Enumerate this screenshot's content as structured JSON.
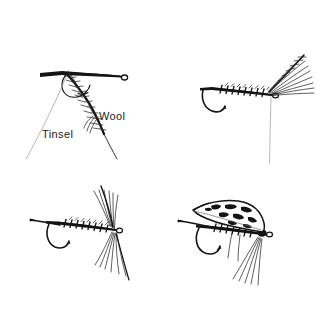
{
  "figure": {
    "background_color": "#ffffff",
    "ink_color": "#141414",
    "width": 330,
    "height": 324
  },
  "labels": {
    "wool": "Wool",
    "tinsel": "Tinsel"
  },
  "panels": [
    {
      "id": "panel-top-left",
      "name": "step-1-tinsel-and-wool",
      "position": "top-left",
      "components": [
        "hook",
        "tinsel-strand",
        "wool-chenille",
        "hook-eye",
        "hook-bend"
      ]
    },
    {
      "id": "panel-top-right",
      "name": "step-2-hackle-wing",
      "position": "top-right",
      "components": [
        "hook",
        "ribbed-body",
        "hackle-fibers",
        "hook-eye",
        "hook-bend",
        "thread-hang"
      ]
    },
    {
      "id": "panel-bottom-left",
      "name": "step-3-swept-hackle",
      "position": "bottom-left",
      "components": [
        "hook",
        "ribbed-body",
        "swept-hackle-fibers",
        "hook-eye",
        "hook-bend",
        "tail"
      ]
    },
    {
      "id": "panel-bottom-right",
      "name": "step-4-barred-feather-wing",
      "position": "bottom-right",
      "components": [
        "hook",
        "ribbed-body",
        "barred-feather-wing",
        "throat-hackle",
        "hook-eye",
        "hook-bend",
        "tail"
      ]
    }
  ]
}
